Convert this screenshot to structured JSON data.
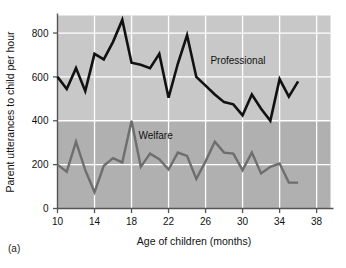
{
  "figure": {
    "caption": "(a)"
  },
  "chart_data": {
    "type": "line",
    "title": "",
    "xlabel": "Age of children (months)",
    "ylabel": "Parent utterances to child per hour",
    "xlim": [
      10,
      39.5
    ],
    "ylim": [
      0,
      880
    ],
    "xticks": [
      10,
      14,
      18,
      22,
      26,
      30,
      34,
      38
    ],
    "xtick_labels": [
      "10",
      "14",
      "18",
      "22",
      "26",
      "30",
      "34",
      "38"
    ],
    "yticks": [
      0,
      200,
      400,
      600,
      800
    ],
    "ytick_labels": [
      "0",
      "200",
      "400",
      "600",
      "800"
    ],
    "grid": true,
    "grid_color": "#ffffff",
    "legend_position": "inline-annotations",
    "plot_bg_upper": "#c8c8c8",
    "plot_bg_lower": "#b0b0b0",
    "bg_split_value": 400,
    "series": [
      {
        "name": "Professional",
        "color": "#111111",
        "line_width": 2.6,
        "label_x": 29.5,
        "label_y": 660,
        "x": [
          10,
          11,
          12,
          13,
          14,
          15,
          16,
          17,
          18,
          19,
          20,
          21,
          22,
          23,
          24,
          25,
          26,
          27,
          28,
          29,
          30,
          31,
          32,
          33,
          34,
          35,
          36
        ],
        "values": [
          600,
          545,
          640,
          535,
          705,
          680,
          760,
          860,
          665,
          655,
          640,
          705,
          505,
          660,
          790,
          600,
          560,
          520,
          485,
          475,
          425,
          520,
          455,
          400,
          590,
          510,
          580
        ]
      },
      {
        "name": "Welfare",
        "color": "#6e6e6e",
        "line_width": 2.4,
        "label_x": 20.6,
        "label_y": 318,
        "x": [
          10,
          11,
          12,
          13,
          14,
          15,
          16,
          17,
          18,
          19,
          20,
          21,
          22,
          23,
          24,
          25,
          26,
          27,
          28,
          29,
          30,
          31,
          32,
          33,
          34,
          35,
          36
        ],
        "values": [
          200,
          168,
          305,
          175,
          75,
          195,
          230,
          210,
          400,
          190,
          250,
          225,
          178,
          255,
          240,
          135,
          215,
          305,
          255,
          250,
          175,
          255,
          160,
          190,
          205,
          118,
          118
        ]
      }
    ]
  }
}
